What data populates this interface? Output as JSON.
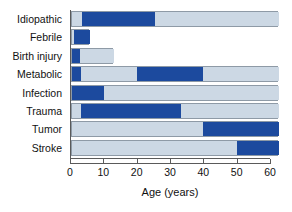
{
  "chart_data": {
    "type": "bar",
    "orientation": "horizontal",
    "title": "",
    "xlabel": "Age (years)",
    "ylabel": "",
    "xlim": [
      0,
      62
    ],
    "xticks": [
      0,
      10,
      20,
      30,
      40,
      50,
      60
    ],
    "xticklabels": [
      "0",
      "10",
      "20",
      "30",
      "40",
      "50",
      "60"
    ],
    "grid": false,
    "legend": "none",
    "colors": {
      "dark": "#1c4a9e",
      "light": "#ccd8e4",
      "axis": "#5a5a5a",
      "bar_border": "#8e9aa6",
      "background": "#ffffff"
    },
    "categories": [
      "Idiopathic",
      "Febrile",
      "Birth injury",
      "Metabolic",
      "Infection",
      "Trauma",
      "Tumor",
      "Stroke"
    ],
    "bars": [
      {
        "category": "Idiopathic",
        "total": 62,
        "segments": [
          {
            "from": 0,
            "to": 3,
            "shade": "light"
          },
          {
            "from": 3,
            "to": 25,
            "shade": "dark"
          },
          {
            "from": 25,
            "to": 62,
            "shade": "light"
          }
        ]
      },
      {
        "category": "Febrile",
        "total": 5.5,
        "segments": [
          {
            "from": 0,
            "to": 0.5,
            "shade": "light"
          },
          {
            "from": 0.5,
            "to": 5.5,
            "shade": "dark"
          }
        ]
      },
      {
        "category": "Birth injury",
        "total": 12.7,
        "segments": [
          {
            "from": 0,
            "to": 2.4,
            "shade": "dark"
          },
          {
            "from": 2.4,
            "to": 12.7,
            "shade": "light"
          }
        ]
      },
      {
        "category": "Metabolic",
        "total": 62,
        "segments": [
          {
            "from": 0,
            "to": 2.6,
            "shade": "dark"
          },
          {
            "from": 2.6,
            "to": 19.5,
            "shade": "light"
          },
          {
            "from": 19.5,
            "to": 39.2,
            "shade": "dark"
          },
          {
            "from": 39.2,
            "to": 62,
            "shade": "light"
          }
        ]
      },
      {
        "category": "Infection",
        "total": 62,
        "segments": [
          {
            "from": 0,
            "to": 9.5,
            "shade": "dark"
          },
          {
            "from": 9.5,
            "to": 62,
            "shade": "light"
          }
        ]
      },
      {
        "category": "Trauma",
        "total": 62,
        "segments": [
          {
            "from": 0,
            "to": 2.6,
            "shade": "light"
          },
          {
            "from": 2.6,
            "to": 32.8,
            "shade": "dark"
          },
          {
            "from": 32.8,
            "to": 62,
            "shade": "light"
          }
        ]
      },
      {
        "category": "Tumor",
        "total": 62,
        "segments": [
          {
            "from": 0,
            "to": 39.2,
            "shade": "light"
          },
          {
            "from": 39.2,
            "to": 62,
            "shade": "dark"
          }
        ]
      },
      {
        "category": "Stroke",
        "total": 62,
        "segments": [
          {
            "from": 0,
            "to": 49.5,
            "shade": "light"
          },
          {
            "from": 49.5,
            "to": 62,
            "shade": "dark"
          }
        ]
      }
    ]
  }
}
